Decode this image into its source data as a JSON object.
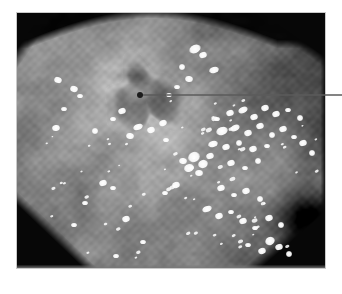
{
  "figure": {
    "kind": "endoscopic-photograph",
    "modality": "white-light gastrointestinal endoscopy",
    "caption_mark": "",
    "background_color": "#ffffff"
  },
  "photo": {
    "name": "endoscopy-image",
    "x": 17,
    "y": 13,
    "width": 308,
    "height": 255,
    "border_color": "#c9c9c9",
    "vignette_color": "#000000",
    "mucosa_base_color": "#8f8f8f",
    "mucosa_light_color": "#bdbdbd",
    "mucosa_shadow_color": "#4a4a4a",
    "specular_highlight_color": "#ffffff",
    "description": "Grayscale endoscopic view of gastric mucosa with a central crater-like ulcerated lesion and scattered bright specular mucus reflections"
  },
  "regions": {
    "lesion": {
      "label": "ulcer-crater",
      "center_x": 128,
      "center_y": 86,
      "radius_x": 44,
      "radius_y": 36,
      "core_color": "#2e2e2e"
    },
    "dark_lumen": {
      "label": "distal-lumen-shadow",
      "center_x": 292,
      "center_y": 205,
      "radius_x": 34,
      "radius_y": 28,
      "core_color": "#171717"
    },
    "pale_halo": {
      "label": "pale-mucosal-halo",
      "center_x": 118,
      "center_y": 92,
      "radius_x": 66,
      "radius_y": 58,
      "core_color": "#cfcfcf"
    }
  },
  "annotation": {
    "name": "lesion-pointer",
    "dot": {
      "x": 140,
      "y": 95,
      "radius": 3,
      "color": "#1c1c1c"
    },
    "line": {
      "x1": 141,
      "y1": 95,
      "x2": 342,
      "y2": 95,
      "color": "#5b5b5b",
      "width": 1.6
    },
    "label_text": ""
  },
  "highlights": [
    {
      "x": 178,
      "y": 36,
      "w": 6,
      "h": 4,
      "a": -25
    },
    {
      "x": 186,
      "y": 42,
      "w": 4,
      "h": 3,
      "a": -20
    },
    {
      "x": 165,
      "y": 54,
      "w": 3,
      "h": 3,
      "a": 0
    },
    {
      "x": 197,
      "y": 57,
      "w": 5,
      "h": 3,
      "a": -15
    },
    {
      "x": 172,
      "y": 66,
      "w": 4,
      "h": 3,
      "a": 10
    },
    {
      "x": 160,
      "y": 74,
      "w": 3,
      "h": 2,
      "a": 0
    },
    {
      "x": 152,
      "y": 82,
      "w": 3,
      "h": 2,
      "a": 0
    },
    {
      "x": 41,
      "y": 67,
      "w": 4,
      "h": 3,
      "a": 20
    },
    {
      "x": 57,
      "y": 76,
      "w": 4,
      "h": 3,
      "a": 15
    },
    {
      "x": 63,
      "y": 83,
      "w": 3,
      "h": 2,
      "a": 0
    },
    {
      "x": 47,
      "y": 96,
      "w": 3,
      "h": 2,
      "a": 0
    },
    {
      "x": 39,
      "y": 115,
      "w": 4,
      "h": 3,
      "a": -10
    },
    {
      "x": 78,
      "y": 118,
      "w": 3,
      "h": 3,
      "a": 0
    },
    {
      "x": 121,
      "y": 114,
      "w": 5,
      "h": 3,
      "a": -20
    },
    {
      "x": 134,
      "y": 117,
      "w": 4,
      "h": 3,
      "a": -15
    },
    {
      "x": 113,
      "y": 123,
      "w": 4,
      "h": 3,
      "a": 10
    },
    {
      "x": 146,
      "y": 110,
      "w": 4,
      "h": 3,
      "a": -25
    },
    {
      "x": 200,
      "y": 106,
      "w": 3,
      "h": 2,
      "a": 0
    },
    {
      "x": 213,
      "y": 100,
      "w": 4,
      "h": 3,
      "a": -20
    },
    {
      "x": 226,
      "y": 97,
      "w": 5,
      "h": 3,
      "a": -25
    },
    {
      "x": 237,
      "y": 104,
      "w": 4,
      "h": 3,
      "a": -20
    },
    {
      "x": 248,
      "y": 95,
      "w": 4,
      "h": 3,
      "a": -15
    },
    {
      "x": 259,
      "y": 101,
      "w": 4,
      "h": 3,
      "a": -20
    },
    {
      "x": 271,
      "y": 97,
      "w": 3,
      "h": 2,
      "a": 0
    },
    {
      "x": 283,
      "y": 105,
      "w": 3,
      "h": 3,
      "a": 0
    },
    {
      "x": 205,
      "y": 118,
      "w": 6,
      "h": 4,
      "a": -20
    },
    {
      "x": 218,
      "y": 115,
      "w": 5,
      "h": 3,
      "a": -25
    },
    {
      "x": 231,
      "y": 120,
      "w": 4,
      "h": 3,
      "a": -15
    },
    {
      "x": 243,
      "y": 113,
      "w": 4,
      "h": 3,
      "a": -20
    },
    {
      "x": 255,
      "y": 122,
      "w": 3,
      "h": 3,
      "a": 0
    },
    {
      "x": 266,
      "y": 116,
      "w": 4,
      "h": 3,
      "a": -20
    },
    {
      "x": 277,
      "y": 124,
      "w": 3,
      "h": 2,
      "a": 0
    },
    {
      "x": 196,
      "y": 131,
      "w": 5,
      "h": 3,
      "a": -15
    },
    {
      "x": 209,
      "y": 134,
      "w": 4,
      "h": 3,
      "a": -20
    },
    {
      "x": 222,
      "y": 130,
      "w": 3,
      "h": 3,
      "a": 0
    },
    {
      "x": 236,
      "y": 136,
      "w": 4,
      "h": 3,
      "a": -15
    },
    {
      "x": 250,
      "y": 133,
      "w": 3,
      "h": 2,
      "a": 0
    },
    {
      "x": 286,
      "y": 130,
      "w": 4,
      "h": 3,
      "a": -20
    },
    {
      "x": 295,
      "y": 140,
      "w": 3,
      "h": 3,
      "a": 0
    },
    {
      "x": 177,
      "y": 144,
      "w": 6,
      "h": 5,
      "a": -25
    },
    {
      "x": 186,
      "y": 151,
      "w": 5,
      "h": 4,
      "a": -20
    },
    {
      "x": 172,
      "y": 155,
      "w": 5,
      "h": 4,
      "a": -15
    },
    {
      "x": 182,
      "y": 160,
      "w": 4,
      "h": 3,
      "a": 0
    },
    {
      "x": 193,
      "y": 143,
      "w": 4,
      "h": 3,
      "a": -20
    },
    {
      "x": 166,
      "y": 148,
      "w": 4,
      "h": 3,
      "a": 10
    },
    {
      "x": 214,
      "y": 150,
      "w": 4,
      "h": 3,
      "a": -20
    },
    {
      "x": 228,
      "y": 155,
      "w": 3,
      "h": 2,
      "a": 0
    },
    {
      "x": 241,
      "y": 148,
      "w": 3,
      "h": 3,
      "a": 0
    },
    {
      "x": 159,
      "y": 172,
      "w": 4,
      "h": 3,
      "a": -15
    },
    {
      "x": 148,
      "y": 180,
      "w": 3,
      "h": 2,
      "a": 0
    },
    {
      "x": 204,
      "y": 175,
      "w": 4,
      "h": 3,
      "a": -20
    },
    {
      "x": 217,
      "y": 182,
      "w": 3,
      "h": 2,
      "a": 0
    },
    {
      "x": 229,
      "y": 178,
      "w": 4,
      "h": 3,
      "a": -15
    },
    {
      "x": 243,
      "y": 186,
      "w": 3,
      "h": 3,
      "a": 0
    },
    {
      "x": 190,
      "y": 196,
      "w": 5,
      "h": 3,
      "a": -20
    },
    {
      "x": 202,
      "y": 203,
      "w": 4,
      "h": 3,
      "a": -15
    },
    {
      "x": 214,
      "y": 199,
      "w": 3,
      "h": 2,
      "a": 0
    },
    {
      "x": 226,
      "y": 208,
      "w": 4,
      "h": 3,
      "a": -20
    },
    {
      "x": 238,
      "y": 215,
      "w": 3,
      "h": 2,
      "a": 0
    },
    {
      "x": 252,
      "y": 205,
      "w": 4,
      "h": 3,
      "a": -15
    },
    {
      "x": 264,
      "y": 212,
      "w": 3,
      "h": 3,
      "a": 0
    },
    {
      "x": 253,
      "y": 228,
      "w": 5,
      "h": 4,
      "a": -25
    },
    {
      "x": 262,
      "y": 234,
      "w": 4,
      "h": 3,
      "a": -20
    },
    {
      "x": 245,
      "y": 238,
      "w": 4,
      "h": 3,
      "a": -15
    },
    {
      "x": 272,
      "y": 241,
      "w": 3,
      "h": 3,
      "a": 0
    },
    {
      "x": 231,
      "y": 232,
      "w": 3,
      "h": 2,
      "a": 0
    },
    {
      "x": 86,
      "y": 170,
      "w": 4,
      "h": 3,
      "a": -20
    },
    {
      "x": 96,
      "y": 175,
      "w": 3,
      "h": 2,
      "a": 0
    },
    {
      "x": 68,
      "y": 190,
      "w": 3,
      "h": 2,
      "a": 0
    },
    {
      "x": 109,
      "y": 206,
      "w": 4,
      "h": 3,
      "a": -15
    },
    {
      "x": 57,
      "y": 212,
      "w": 3,
      "h": 2,
      "a": 0
    },
    {
      "x": 126,
      "y": 229,
      "w": 3,
      "h": 2,
      "a": 0
    },
    {
      "x": 99,
      "y": 243,
      "w": 3,
      "h": 2,
      "a": 0
    },
    {
      "x": 149,
      "y": 127,
      "w": 3,
      "h": 2,
      "a": 0
    },
    {
      "x": 105,
      "y": 98,
      "w": 4,
      "h": 3,
      "a": -20
    },
    {
      "x": 96,
      "y": 106,
      "w": 3,
      "h": 2,
      "a": 0
    }
  ]
}
